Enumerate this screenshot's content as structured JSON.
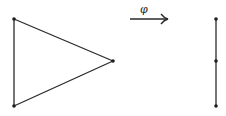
{
  "diagram": {
    "source_graph": {
      "name": "triangle (K3)",
      "vertices": [
        {
          "id": "a",
          "x": 14,
          "y": 19
        },
        {
          "id": "b",
          "x": 14,
          "y": 106
        },
        {
          "id": "c",
          "x": 113,
          "y": 61
        }
      ],
      "edges": [
        [
          "a",
          "b"
        ],
        [
          "a",
          "c"
        ],
        [
          "b",
          "c"
        ]
      ]
    },
    "map": {
      "label": "φ",
      "arrow": {
        "x1": 130,
        "y1": 19,
        "x2": 168,
        "y2": 19
      }
    },
    "target_graph": {
      "name": "path (P3)",
      "vertices": [
        {
          "id": "p",
          "x": 216,
          "y": 19
        },
        {
          "id": "q",
          "x": 216,
          "y": 61
        },
        {
          "id": "r",
          "x": 216,
          "y": 106
        }
      ],
      "edges": [
        [
          "p",
          "q"
        ],
        [
          "q",
          "r"
        ]
      ]
    },
    "colors": {
      "stroke": "#2a2a2a",
      "vertex": "#1e1e1e",
      "background": "#ffffff"
    }
  }
}
